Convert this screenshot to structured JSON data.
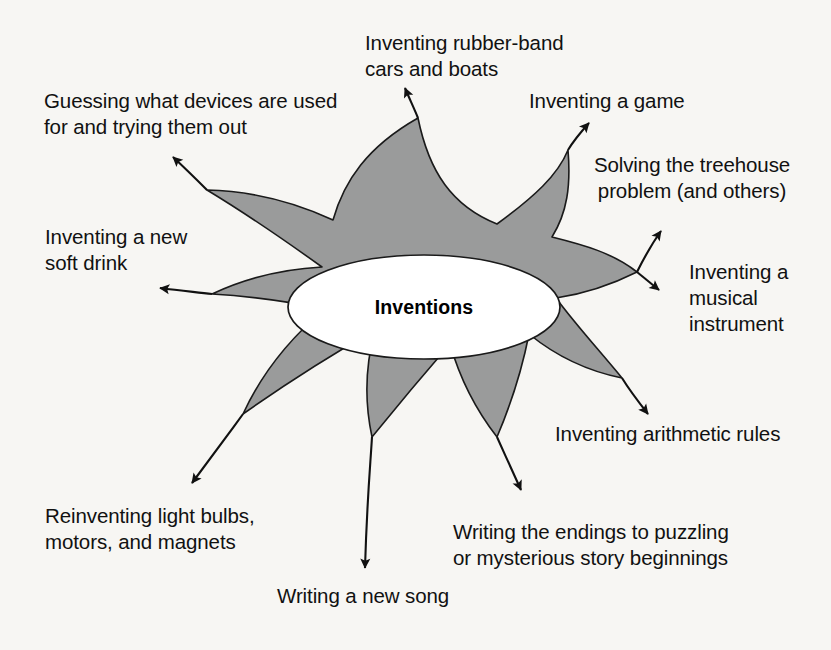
{
  "diagram": {
    "type": "starburst-idea-web",
    "center": {
      "label": "Inventions",
      "shape": "ellipse",
      "fill_color": "#ffffff"
    },
    "burst": {
      "fill_color": "#9a9b9b",
      "stroke_color": "#1a1a1a",
      "spike_count": 8
    },
    "background_color": "#f7f6f3",
    "text_color": "#111111",
    "spokes": [
      {
        "id": "rubber-band-cars",
        "label": "Inventing rubber-band\ncars and boats",
        "direction": "up",
        "align": "left"
      },
      {
        "id": "inventing-a-game",
        "label": "Inventing a game",
        "direction": "up-right",
        "align": "left"
      },
      {
        "id": "treehouse-problem",
        "label": "Solving the treehouse\nproblem (and others)",
        "direction": "right-up",
        "align": "center"
      },
      {
        "id": "musical-instrument",
        "label": "Inventing a\nmusical\ninstrument",
        "direction": "right",
        "align": "left"
      },
      {
        "id": "arithmetic-rules",
        "label": "Inventing arithmetic rules",
        "direction": "right-down",
        "align": "left"
      },
      {
        "id": "story-endings",
        "label": "Writing the endings to puzzling\nor mysterious story beginnings",
        "direction": "down-right",
        "align": "left"
      },
      {
        "id": "new-song",
        "label": "Writing a new song",
        "direction": "down",
        "align": "left"
      },
      {
        "id": "light-bulbs",
        "label": "Reinventing light bulbs,\nmotors, and magnets",
        "direction": "down-left",
        "align": "left"
      },
      {
        "id": "soft-drink",
        "label": "Inventing a new\nsoft drink",
        "direction": "left",
        "align": "left"
      },
      {
        "id": "guessing-devices",
        "label": "Guessing what devices are used\nfor and trying them out",
        "direction": "up-left",
        "align": "left"
      }
    ]
  }
}
